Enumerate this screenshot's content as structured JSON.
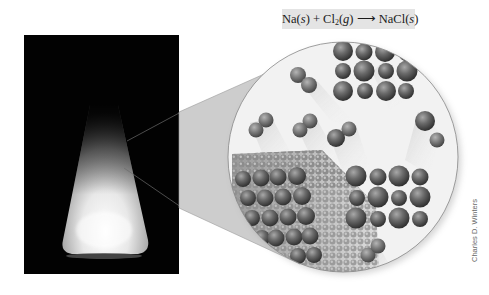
{
  "equation": {
    "reactant1": "Na",
    "reactant1_state": "s",
    "plus": "+",
    "reactant2": "Cl",
    "reactant2_subscript": "2",
    "reactant2_state": "g",
    "arrow": "⟶",
    "product": "NaCl",
    "product_state": "s",
    "full_text": "Na(s) + Cl2(g) → NaCl(s)"
  },
  "photo": {
    "subject": "erlenmeyer-flask-glowing",
    "background_color": "#000000"
  },
  "magnified_view": {
    "subject": "sodium-metal-lattice-reacting-with-chlorine-molecules",
    "sphere_color": "#5a5a5a",
    "na_cl_clusters": [
      {
        "name": "top-cluster",
        "rows": 3,
        "cols": 4
      },
      {
        "name": "right-cluster",
        "rows": 3,
        "cols": 4
      }
    ],
    "cl2_molecule_count": 7
  },
  "credit": {
    "text": "Charles D. Winters"
  },
  "colors": {
    "callout_fill": "#c8c8c8",
    "callout_line": "#8a8a8a",
    "equation_bg": "#e4e4e4"
  }
}
